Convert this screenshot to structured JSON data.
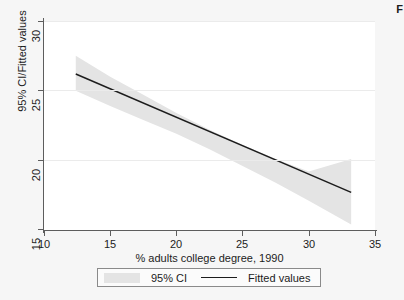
{
  "corner_mark": "F",
  "chart_data": {
    "type": "line",
    "title": "",
    "subtitle": "",
    "xlabel": "% adults college degree, 1990",
    "ylabel": "95% CI/Fitted values",
    "xlim": [
      10,
      35
    ],
    "ylim": [
      15,
      30
    ],
    "xticks": [
      10,
      15,
      20,
      25,
      30,
      35
    ],
    "yticks": [
      15,
      20,
      25,
      30
    ],
    "xtick_labels": [
      "10",
      "15",
      "20",
      "25",
      "30",
      "35"
    ],
    "ytick_labels": [
      "15",
      "20",
      "25",
      "30"
    ],
    "grid": "horizontal-gridlines-at-yticks",
    "legend_position": "below-axis-centered",
    "series": [
      {
        "name": "Fitted values",
        "type": "line",
        "color": "#1c1c1c",
        "x": [
          12.4,
          33.2
        ],
        "values": [
          26.2,
          17.7
        ]
      },
      {
        "name": "95% CI",
        "type": "band",
        "color": "#e4e4e4",
        "x": [
          12.4,
          15.0,
          17.5,
          20.0,
          22.5,
          25.0,
          27.5,
          30.0,
          33.2
        ],
        "lower": [
          25.0,
          23.9,
          22.9,
          21.9,
          20.8,
          19.6,
          18.4,
          17.1,
          15.4
        ],
        "upper": [
          27.5,
          26.0,
          24.7,
          23.4,
          22.2,
          21.1,
          20.1,
          19.2,
          20.1
        ]
      }
    ],
    "annotations": []
  },
  "legend": {
    "entries": [
      {
        "label": "95% CI",
        "glyph": "filled-band-swatch"
      },
      {
        "label": "Fitted values",
        "glyph": "solid-line"
      }
    ]
  },
  "colors": {
    "background": "#f6f6f6",
    "plot_background": "#ffffff",
    "axis": "#5d5d5d",
    "gridline": "#ebebeb",
    "band_fill": "#e4e4e4",
    "line": "#1c1c1c",
    "text": "#1c1c1c",
    "legend_border": "#8a8a8a"
  }
}
